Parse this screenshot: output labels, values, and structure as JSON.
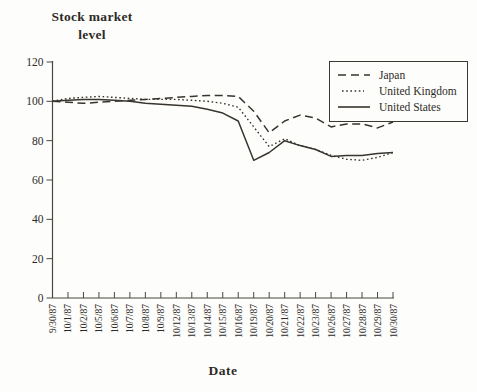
{
  "figure": {
    "y_axis_title": {
      "line1": "Stock market",
      "line2": "level"
    },
    "x_axis_title": "Date"
  },
  "colors": {
    "ink": "#2e2b27",
    "line": "#38342e",
    "axis": "#4a463f",
    "background": "#fdfdfb"
  },
  "chart_data": {
    "type": "line",
    "title": "",
    "xlabel": "Date",
    "ylabel": "Stock market level",
    "ylim": [
      0,
      120
    ],
    "yticks": [
      0,
      20,
      40,
      60,
      80,
      100,
      120
    ],
    "grid": false,
    "legend_position": "top-right",
    "x": [
      "9/30/87",
      "10/1/87",
      "10/2/87",
      "10/5/87",
      "10/6/87",
      "10/7/87",
      "10/8/87",
      "10/9/87",
      "10/12/87",
      "10/13/87",
      "10/14/87",
      "10/15/87",
      "10/16/87",
      "10/19/87",
      "10/20/87",
      "10/21/87",
      "10/22/87",
      "10/23/87",
      "10/26/87",
      "10/27/87",
      "10/28/87",
      "10/29/87",
      "10/30/87"
    ],
    "series": [
      {
        "name": "Japan",
        "style": "dashed",
        "values": [
          100,
          99.5,
          99,
          99.5,
          100,
          100.5,
          101,
          101.5,
          102,
          102.5,
          103,
          103,
          102.5,
          95,
          84,
          90,
          93,
          91.5,
          87,
          88.5,
          88.5,
          86.5,
          89.5
        ]
      },
      {
        "name": "United Kingdom",
        "style": "dotted",
        "values": [
          100,
          101.5,
          102,
          102.5,
          102,
          101.5,
          101,
          101,
          101,
          100.5,
          100,
          99,
          97,
          87,
          77,
          81,
          77.5,
          75.5,
          72.5,
          70.5,
          70,
          71.5,
          74
        ]
      },
      {
        "name": "United States",
        "style": "solid",
        "values": [
          100,
          100.5,
          101,
          101,
          100.5,
          100,
          99,
          98.5,
          98,
          97.5,
          96,
          94,
          90,
          70,
          74,
          80,
          77.5,
          75.5,
          72,
          72.5,
          72.5,
          73.5,
          74
        ]
      }
    ]
  }
}
